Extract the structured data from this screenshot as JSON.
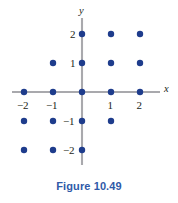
{
  "caption": "Figure 10.49",
  "caption_color": "#2f5aa8",
  "axes": {
    "x_name": "x",
    "y_name": "y",
    "axis_color": "#a9a9ad",
    "x_tick_labels": [
      "−2",
      "−1",
      "1",
      "2"
    ],
    "y_tick_labels": [
      "2",
      "1",
      "−1",
      "−2"
    ]
  },
  "chart_data": {
    "type": "scatter",
    "title": "Figure 10.49",
    "xlabel": "x",
    "ylabel": "y",
    "xlim": [
      -2.6,
      2.6
    ],
    "ylim": [
      -2.6,
      2.6
    ],
    "grid": false,
    "legend": null,
    "xticks": [
      -2,
      -1,
      1,
      2
    ],
    "yticks": [
      2,
      1,
      -1,
      -2
    ],
    "marker_color": "#1e3c8c",
    "series": [
      {
        "name": "lattice points",
        "points": [
          [
            0,
            2
          ],
          [
            1,
            2
          ],
          [
            2,
            2
          ],
          [
            -1,
            1
          ],
          [
            0,
            1
          ],
          [
            1,
            1
          ],
          [
            2,
            1
          ],
          [
            -2,
            0
          ],
          [
            -1,
            0
          ],
          [
            0,
            0
          ],
          [
            1,
            0
          ],
          [
            2,
            0
          ],
          [
            -2,
            -1
          ],
          [
            -1,
            -1
          ],
          [
            0,
            -1
          ],
          [
            1,
            -1
          ],
          [
            -2,
            -2
          ],
          [
            -1,
            -2
          ],
          [
            0,
            -2
          ]
        ]
      }
    ]
  },
  "geometry": {
    "origin_x": 82,
    "origin_y": 92,
    "unit": 29,
    "dot_radius": 3.2,
    "x_axis_start": 12,
    "x_axis_end": 160,
    "y_axis_top": 18,
    "y_axis_bottom": 165
  }
}
